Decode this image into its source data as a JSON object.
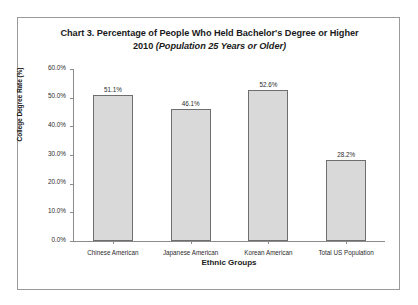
{
  "figure": {
    "title_line1": "Chart 3. Percentage of People Who Held Bachelor's Degree or Higher",
    "title_line2_a": "2010 ",
    "title_line2_b": "(Population 25 Years or Older)"
  },
  "chart_data": {
    "type": "bar",
    "title": "Chart 3. Percentage of People Who Held Bachelor's Degree or Higher 2010 (Population 25 Years or Older)",
    "categories": [
      "Chinese American",
      "Japanese American",
      "Korean American",
      "Total US Population"
    ],
    "values": [
      51.1,
      46.1,
      52.6,
      28.2
    ],
    "value_labels": [
      "51.1%",
      "46.1%",
      "52.6%",
      "28.2%"
    ],
    "xlabel": "Ethnic Groups",
    "ylabel": "College Degree Rate (%)",
    "ylim": [
      0,
      60
    ],
    "ytick_labels": [
      "60.0%",
      "50.0%",
      "40.0%",
      "30.0%",
      "20.0%",
      "10.0%",
      "0.0%"
    ],
    "ytick_values": [
      60,
      50,
      40,
      30,
      20,
      10,
      0
    ],
    "grid": false,
    "legend": "none",
    "bar_color": "#d9d9d9",
    "bar_border_color": "#6e6e6e",
    "axis_color": "#8c8c8c"
  }
}
